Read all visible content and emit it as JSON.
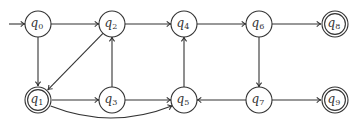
{
  "diagram": {
    "type": "finite-automaton",
    "stroke_color": "#333333",
    "background": "#ffffff",
    "start_state": "q0",
    "nodes": [
      {
        "id": "q0",
        "label": "q",
        "sub": "0",
        "x": 38,
        "y": 24,
        "accepting": false
      },
      {
        "id": "q2",
        "label": "q",
        "sub": "2",
        "x": 112,
        "y": 24,
        "accepting": false
      },
      {
        "id": "q4",
        "label": "q",
        "sub": "4",
        "x": 184,
        "y": 24,
        "accepting": false
      },
      {
        "id": "q6",
        "label": "q",
        "sub": "6",
        "x": 259,
        "y": 24,
        "accepting": false
      },
      {
        "id": "q8",
        "label": "q",
        "sub": "8",
        "x": 335,
        "y": 24,
        "accepting": true
      },
      {
        "id": "q1",
        "label": "q",
        "sub": "1",
        "x": 38,
        "y": 100,
        "accepting": true
      },
      {
        "id": "q3",
        "label": "q",
        "sub": "3",
        "x": 112,
        "y": 100,
        "accepting": false
      },
      {
        "id": "q5",
        "label": "q",
        "sub": "5",
        "x": 184,
        "y": 100,
        "accepting": false
      },
      {
        "id": "q7",
        "label": "q",
        "sub": "7",
        "x": 259,
        "y": 100,
        "accepting": false
      },
      {
        "id": "q9",
        "label": "q",
        "sub": "9",
        "x": 335,
        "y": 100,
        "accepting": true
      }
    ],
    "edges": [
      {
        "from": "q0",
        "to": "q2"
      },
      {
        "from": "q0",
        "to": "q1"
      },
      {
        "from": "q2",
        "to": "q4"
      },
      {
        "from": "q2",
        "to": "q1"
      },
      {
        "from": "q4",
        "to": "q6"
      },
      {
        "from": "q6",
        "to": "q8"
      },
      {
        "from": "q6",
        "to": "q7"
      },
      {
        "from": "q1",
        "to": "q3"
      },
      {
        "from": "q1",
        "to": "q5",
        "curved": true
      },
      {
        "from": "q3",
        "to": "q2"
      },
      {
        "from": "q3",
        "to": "q5"
      },
      {
        "from": "q5",
        "to": "q4"
      },
      {
        "from": "q7",
        "to": "q5"
      },
      {
        "from": "q7",
        "to": "q9"
      }
    ]
  }
}
